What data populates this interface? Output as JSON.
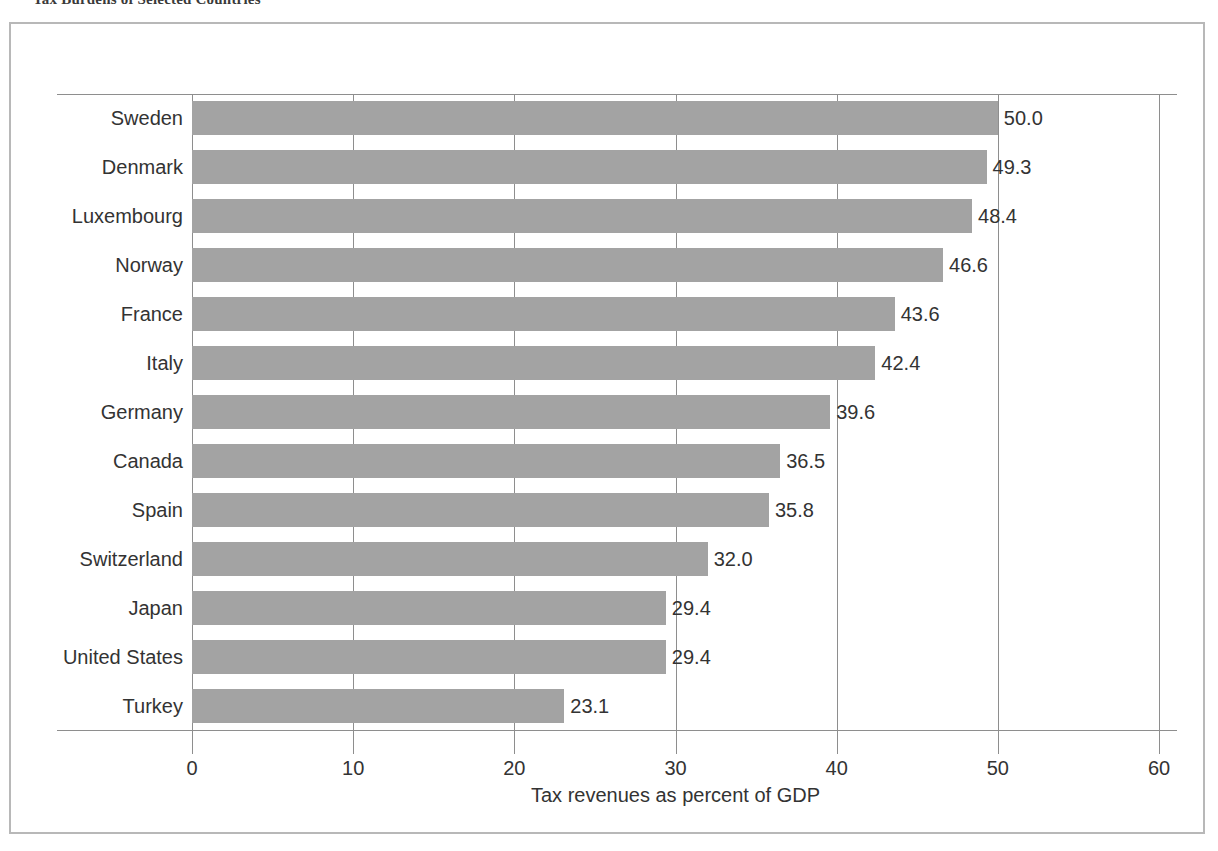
{
  "figure": {
    "caption": "Tax Burdens of Selected Countries",
    "frame_color": "#b8b8b8"
  },
  "chart_data": {
    "type": "bar",
    "orientation": "horizontal",
    "title": "",
    "xlabel": "Tax revenues as percent of GDP",
    "ylabel": "",
    "xlim": [
      0,
      60
    ],
    "xticks": [
      0,
      10,
      20,
      30,
      40,
      50,
      60
    ],
    "xtick_labels": [
      "0",
      "10",
      "20",
      "30",
      "40",
      "50",
      "60"
    ],
    "grid": "vertical",
    "legend": null,
    "bar_color": "#a3a3a3",
    "axis_color": "#8e8e8e",
    "categories": [
      "Sweden",
      "Denmark",
      "Luxembourg",
      "Norway",
      "France",
      "Italy",
      "Germany",
      "Canada",
      "Spain",
      "Switzerland",
      "Japan",
      "United States",
      "Turkey"
    ],
    "values": [
      50.0,
      49.3,
      48.4,
      46.6,
      43.6,
      42.4,
      39.6,
      36.5,
      35.8,
      32.0,
      29.4,
      29.4,
      23.1
    ],
    "data_labels": [
      "50.0",
      "49.3",
      "48.4",
      "46.6",
      "43.6",
      "42.4",
      "39.6",
      "36.5",
      "35.8",
      "32.0",
      "29.4",
      "29.4",
      "23.1"
    ]
  }
}
